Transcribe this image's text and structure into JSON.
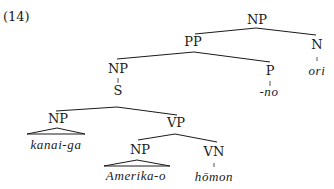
{
  "example_number": "(14)",
  "tree": {
    "nodes": {
      "np_root": {
        "label": "NP",
        "x": 257,
        "y": 24
      },
      "pp": {
        "label": "PP",
        "x": 193,
        "y": 46
      },
      "n": {
        "label": "N",
        "x": 317,
        "y": 49
      },
      "np_mid": {
        "label": "NP",
        "x": 118,
        "y": 73
      },
      "p": {
        "label": "P",
        "x": 270,
        "y": 75
      },
      "s": {
        "label": "S",
        "x": 118,
        "y": 95
      },
      "np_subj": {
        "label": "NP",
        "x": 58,
        "y": 123
      },
      "vp": {
        "label": "VP",
        "x": 176,
        "y": 127
      },
      "np_obj": {
        "label": "NP",
        "x": 140,
        "y": 154
      },
      "vn": {
        "label": "VN",
        "x": 214,
        "y": 156
      }
    },
    "leaves": {
      "ori": {
        "text": "ori",
        "x": 317,
        "y": 75
      },
      "no": {
        "text": "-no",
        "x": 269,
        "y": 96
      },
      "kanai_ga": {
        "text": "kanai-ga",
        "x": 56,
        "y": 149
      },
      "amerika_o": {
        "text": "Amerika-o",
        "x": 136,
        "y": 180
      },
      "homon": {
        "text": "hōmon",
        "x": 214,
        "y": 181
      }
    }
  }
}
